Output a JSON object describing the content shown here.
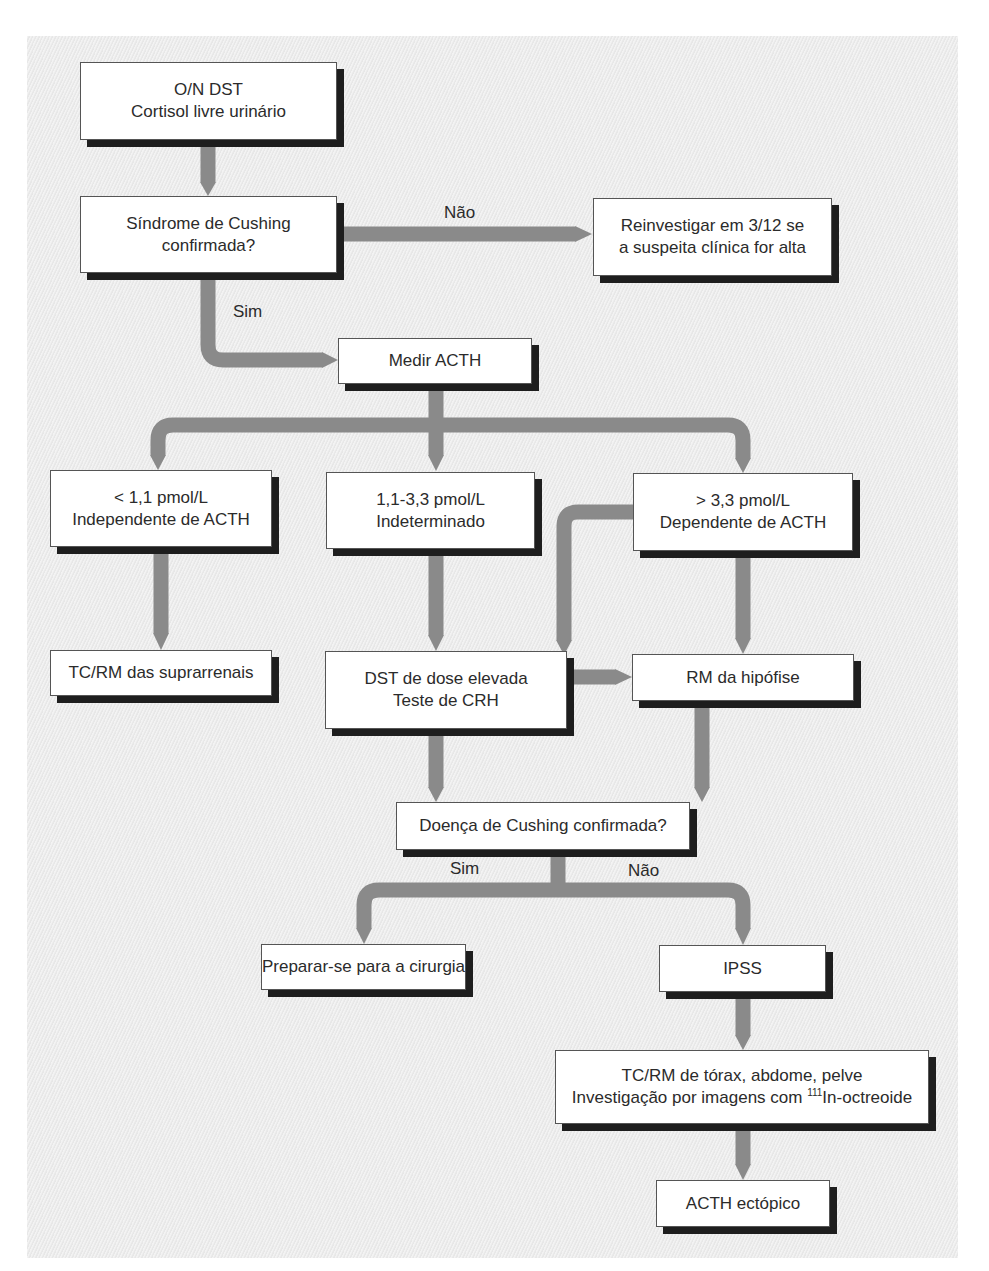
{
  "diagram": {
    "type": "flowchart",
    "colors": {
      "arrow": "#8a8a8a",
      "box_fill": "#ffffff",
      "box_shadow": "#1e1e1e",
      "background": "#ececec"
    },
    "nodes": {
      "n1": {
        "line1": "O/N DST",
        "line2": "Cortisol livre urinário"
      },
      "n2": {
        "line1": "Síndrome de Cushing",
        "line2": "confirmada?"
      },
      "n3": {
        "line1": "Reinvestigar em 3/12 se",
        "line2": "a suspeita clínica for alta"
      },
      "n4": {
        "line1": "Medir ACTH"
      },
      "n5": {
        "line1": "< 1,1 pmol/L",
        "line2": "Independente de ACTH"
      },
      "n6": {
        "line1": "1,1-3,3 pmol/L",
        "line2": "Indeterminado"
      },
      "n7": {
        "line1": "> 3,3 pmol/L",
        "line2": "Dependente de ACTH"
      },
      "n8": {
        "line1": "TC/RM das suprarrenais"
      },
      "n9": {
        "line1": "DST de dose elevada",
        "line2": "Teste de CRH"
      },
      "n10": {
        "line1": "RM da hipófise"
      },
      "n11": {
        "line1": "Doença de Cushing confirmada?"
      },
      "n12": {
        "line1": "Preparar-se para a cirurgia"
      },
      "n13": {
        "line1": "IPSS"
      },
      "n14": {
        "line1": "TC/RM de tórax, abdome, pelve",
        "line2_prefix": "Investigação por imagens com ",
        "line2_sup": "111",
        "line2_suffix": "In-octreoide"
      },
      "n15": {
        "line1": "ACTH ectópico"
      }
    },
    "edge_labels": {
      "n2_no": "Não",
      "n2_yes": "Sim",
      "n11_yes": "Sim",
      "n11_no": "Não"
    },
    "edges": [
      {
        "from": "n1",
        "to": "n2"
      },
      {
        "from": "n2",
        "to": "n3",
        "label": "Não"
      },
      {
        "from": "n2",
        "to": "n4",
        "label": "Sim"
      },
      {
        "from": "n4",
        "to": "n5"
      },
      {
        "from": "n4",
        "to": "n6"
      },
      {
        "from": "n4",
        "to": "n7"
      },
      {
        "from": "n5",
        "to": "n8"
      },
      {
        "from": "n6",
        "to": "n9"
      },
      {
        "from": "n7",
        "to": "n9"
      },
      {
        "from": "n7",
        "to": "n10"
      },
      {
        "from": "n9",
        "to": "n10"
      },
      {
        "from": "n9",
        "to": "n11"
      },
      {
        "from": "n10",
        "to": "n11"
      },
      {
        "from": "n11",
        "to": "n12",
        "label": "Sim"
      },
      {
        "from": "n11",
        "to": "n13",
        "label": "Não"
      },
      {
        "from": "n13",
        "to": "n14"
      },
      {
        "from": "n14",
        "to": "n15"
      }
    ]
  }
}
